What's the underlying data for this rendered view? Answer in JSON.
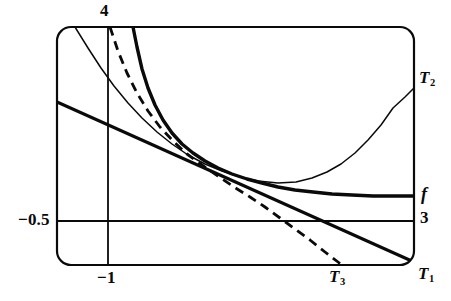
{
  "figure": {
    "background_color": "#ffffff",
    "ink_color": "#0a0a0a",
    "width": 451,
    "height": 301
  },
  "axes": {
    "frame": {
      "x": 57,
      "y": 27,
      "width": 357,
      "height": 238,
      "corner_radius": 14,
      "stroke_width": 2.2
    },
    "top_tick_label": "4",
    "left_tick_label": "−0.5",
    "bottom_tick_label": "−1",
    "right_tick_label": "3",
    "vertical_gridline_x": -1,
    "horizontal_gridline_y": -0.5,
    "xlim": [
      -1.6,
      3.0
    ],
    "ylim": [
      -0.9,
      4.0
    ]
  },
  "curve_labels": {
    "f": "f",
    "t1_base": "T",
    "t1_sub": "1",
    "t2_base": "T",
    "t2_sub": "2",
    "t3_base": "T",
    "t3_sub": "3"
  },
  "chart_data": {
    "type": "line",
    "xlabel": "",
    "ylabel": "",
    "xlim": [
      -1.6,
      3.0
    ],
    "ylim": [
      -0.9,
      4.0
    ],
    "grid": true,
    "gridlines": {
      "vertical": [
        -1
      ],
      "horizontal": [
        -0.5
      ]
    },
    "tick_labels": {
      "top": "4",
      "left": "−0.5",
      "bottom": "−1",
      "right": "3"
    },
    "legend": "inline-end-labels",
    "annotations": [
      {
        "text": "f",
        "x": 3.0,
        "y": 0.55
      },
      {
        "text": "T₁",
        "x": 3.0,
        "y": -0.85
      },
      {
        "text": "T₂",
        "x": 3.0,
        "y": 2.95
      },
      {
        "text": "T₃",
        "x": 2.25,
        "y": -0.9
      }
    ],
    "series": [
      {
        "name": "f",
        "style": "solid-thick",
        "stroke_width": 3.4,
        "points_px": [
          [
            133,
            27
          ],
          [
            137,
            47
          ],
          [
            142,
            69
          ],
          [
            148,
            88
          ],
          [
            155,
            105
          ],
          [
            163,
            120
          ],
          [
            172,
            133
          ],
          [
            182,
            144
          ],
          [
            193,
            153
          ],
          [
            205,
            161
          ],
          [
            218,
            168
          ],
          [
            232,
            174
          ],
          [
            247,
            179
          ],
          [
            262,
            183
          ],
          [
            278,
            187
          ],
          [
            295,
            190
          ],
          [
            313,
            192
          ],
          [
            332,
            194
          ],
          [
            352,
            195
          ],
          [
            373,
            196
          ],
          [
            393,
            196
          ],
          [
            414,
            196
          ]
        ]
      },
      {
        "name": "T₁",
        "style": "solid-thick",
        "stroke_width": 3.2,
        "points_px": [
          [
            57,
            102
          ],
          [
            414,
            262
          ]
        ]
      },
      {
        "name": "T₂",
        "style": "solid-thin",
        "stroke_width": 1.5,
        "points_px": [
          [
            75,
            27
          ],
          [
            88,
            48
          ],
          [
            101,
            68
          ],
          [
            114,
            86
          ],
          [
            128,
            103
          ],
          [
            142,
            118
          ],
          [
            157,
            132
          ],
          [
            172,
            144
          ],
          [
            188,
            155
          ],
          [
            205,
            164
          ],
          [
            222,
            171
          ],
          [
            240,
            177
          ],
          [
            258,
            181
          ],
          [
            278,
            183
          ],
          [
            296,
            182
          ],
          [
            312,
            178
          ],
          [
            327,
            172
          ],
          [
            341,
            164
          ],
          [
            355,
            153
          ],
          [
            368,
            140
          ],
          [
            381,
            125
          ],
          [
            393,
            108
          ],
          [
            405,
            97
          ],
          [
            414,
            88
          ]
        ]
      },
      {
        "name": "T₃",
        "style": "dashed",
        "stroke_width": 2.8,
        "dash_pattern": "9 6",
        "points_px": [
          [
            110,
            27
          ],
          [
            118,
            51
          ],
          [
            127,
            73
          ],
          [
            137,
            93
          ],
          [
            148,
            111
          ],
          [
            160,
            127
          ],
          [
            173,
            141
          ],
          [
            187,
            154
          ],
          [
            202,
            165
          ],
          [
            218,
            176
          ],
          [
            234,
            187
          ],
          [
            250,
            197
          ],
          [
            265,
            207
          ],
          [
            280,
            218
          ],
          [
            295,
            229
          ],
          [
            310,
            240
          ],
          [
            325,
            252
          ],
          [
            338,
            262
          ],
          [
            343,
            266
          ]
        ]
      }
    ]
  }
}
